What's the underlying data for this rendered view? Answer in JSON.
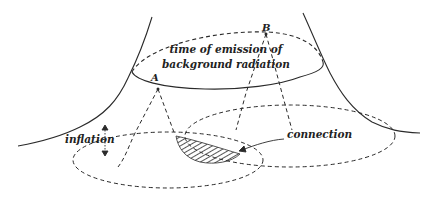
{
  "diagram": {
    "title_line1": "time of emission of",
    "title_line2": "background radiation",
    "point_a": "A",
    "point_b": "B",
    "inflation_label": "inflation",
    "connection_label": "connection"
  },
  "colors": {
    "stroke": "#2a2a2a",
    "background": "#ffffff"
  }
}
